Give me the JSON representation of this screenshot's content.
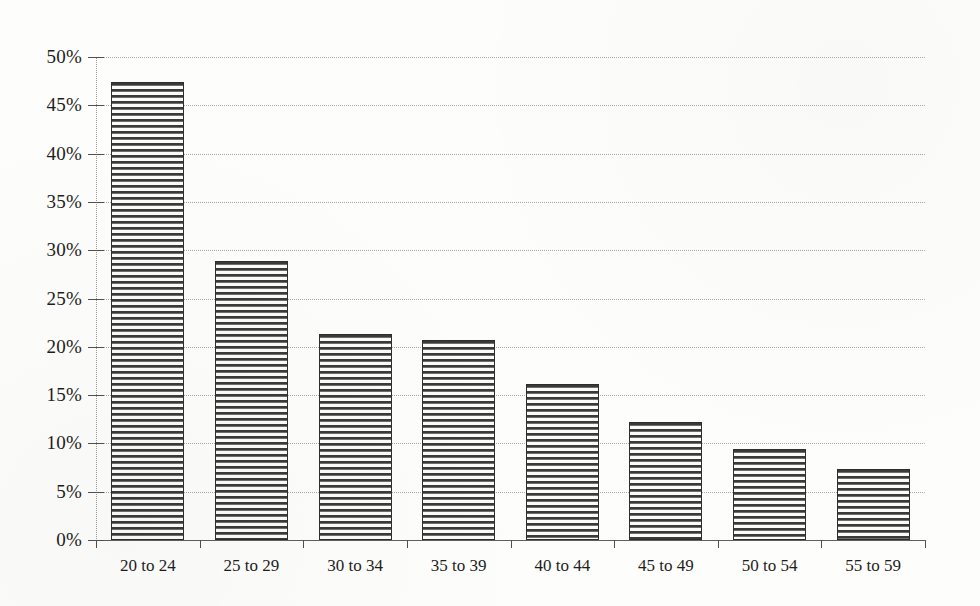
{
  "chart_data": {
    "type": "bar",
    "title": "",
    "xlabel": "",
    "ylabel": "",
    "categories": [
      "20 to 24",
      "25 to 29",
      "30 to 34",
      "35 to 39",
      "40 to 44",
      "45 to 49",
      "50 to 54",
      "55 to 59"
    ],
    "values": [
      47.4,
      28.9,
      21.3,
      20.7,
      16.2,
      12.2,
      9.4,
      7.4
    ],
    "value_format": "percent",
    "ylim": [
      0,
      50
    ],
    "ytick_labels": [
      "0%",
      "5%",
      "10%",
      "15%",
      "20%",
      "25%",
      "30%",
      "35%",
      "40%",
      "45%",
      "50%"
    ],
    "ytick_values": [
      0,
      5,
      10,
      15,
      20,
      25,
      30,
      35,
      40,
      45,
      50
    ],
    "grid": true,
    "grid_axis": "y",
    "grid_style": "dotted",
    "legend": false,
    "legend_position": "none",
    "bar_fill": "horizontal-hatch",
    "colors": {
      "background": "#fdfdfb",
      "bar_fill_dark": "#3a3a3a",
      "bar_fill_light": "#fbfbf9",
      "bar_outline": "#2e2e2e",
      "gridline": "#a9a9a9",
      "axis": "#5f5f5f",
      "text": "#1d1d1d"
    }
  }
}
